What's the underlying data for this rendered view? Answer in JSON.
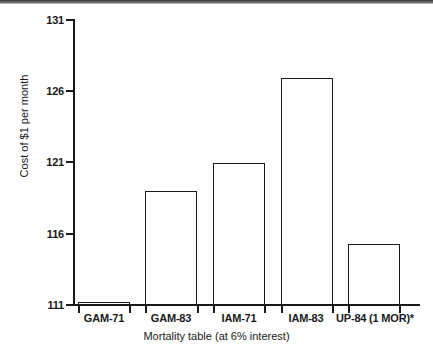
{
  "chart_data": {
    "type": "bar",
    "title": "",
    "subtitle": "",
    "xlabel": "Mortality table (at 6% interest)",
    "ylabel": "Cost of $1 per month",
    "categories": [
      "GAM-71",
      "GAM-83",
      "IAM-71",
      "IAM-83",
      "UP-84 (1 MOR)*"
    ],
    "values": [
      111.2,
      119.0,
      121.0,
      126.9,
      115.3
    ],
    "ylim": [
      111,
      131
    ],
    "yticks": [
      111,
      116,
      121,
      126,
      131
    ],
    "ytick_labels": [
      "111",
      "116",
      "121",
      "126",
      "131"
    ],
    "grid": false,
    "legend": null,
    "series": [
      {
        "name": "Cost of $1 per month",
        "values": [
          111.2,
          119.0,
          121.0,
          126.9,
          115.3
        ]
      }
    ],
    "annotations": [
      "*"
    ],
    "bar_style": {
      "fill": "#ffffff",
      "edge": "#1a1a1a"
    }
  },
  "figure": {
    "background": "#ffffff",
    "axis_color": "#1a1a1a"
  }
}
